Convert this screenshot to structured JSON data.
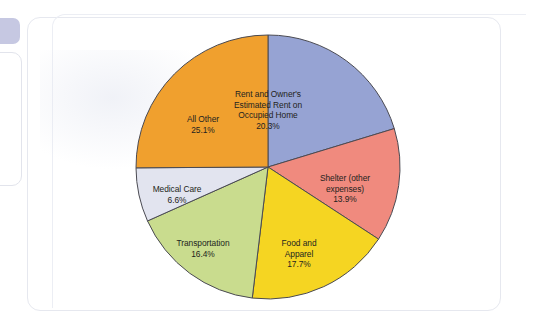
{
  "chart_data": {
    "type": "pie",
    "title": "",
    "subtitle": "",
    "xlabel": "",
    "ylabel": "",
    "legend": "none",
    "grid": false,
    "units": "percent",
    "start_angle_deg": 0,
    "direction": "clockwise",
    "center": {
      "x": 268,
      "y": 167,
      "radius": 132
    },
    "categories": [
      "Rent and Owner's Estimated Rent on Occupied Home",
      "Shelter (other expenses)",
      "Food and Apparel",
      "Transportation",
      "Medical Care",
      "All Other"
    ],
    "values": [
      20.3,
      13.9,
      17.7,
      16.4,
      6.6,
      25.1
    ],
    "colors": [
      "#96a3d3",
      "#f08a7e",
      "#f5d522",
      "#c9dc8e",
      "#e2e4ef",
      "#f0a02e"
    ],
    "slices": [
      {
        "name": "rent-owners-estimated-rent",
        "label": "Rent and Owner's\nEstimated Rent on\nOccupied Home",
        "value_label": "20.3%",
        "value": 20.3,
        "color": "#96a3d3",
        "start_deg": 0,
        "end_deg": 73.08
      },
      {
        "name": "shelter-other-expenses",
        "label": "Shelter (other\nexpenses)",
        "value_label": "13.9%",
        "value": 13.9,
        "color": "#f08a7e",
        "start_deg": 73.08,
        "end_deg": 123.12
      },
      {
        "name": "food-and-apparel",
        "label": "Food and\nApparel",
        "value_label": "17.7%",
        "value": 17.7,
        "color": "#f5d522",
        "start_deg": 123.12,
        "end_deg": 186.84
      },
      {
        "name": "transportation",
        "label": "Transportation",
        "value_label": "16.4%",
        "value": 16.4,
        "color": "#c9dc8e",
        "start_deg": 186.84,
        "end_deg": 245.88
      },
      {
        "name": "medical-care",
        "label": "Medical Care",
        "value_label": "6.6%",
        "value": 6.6,
        "color": "#e2e4ef",
        "start_deg": 245.88,
        "end_deg": 269.64
      },
      {
        "name": "all-other",
        "label": "All Other",
        "value_label": "25.1%",
        "value": 25.1,
        "color": "#f0a02e",
        "start_deg": 269.64,
        "end_deg": 360
      }
    ]
  },
  "style": {
    "slice_outline": "#4a4a52",
    "page_background": "#ffffff",
    "panel_border": "#e6e8ef",
    "tab_chip": "#c6c8e2",
    "label_text": "#231f20"
  }
}
